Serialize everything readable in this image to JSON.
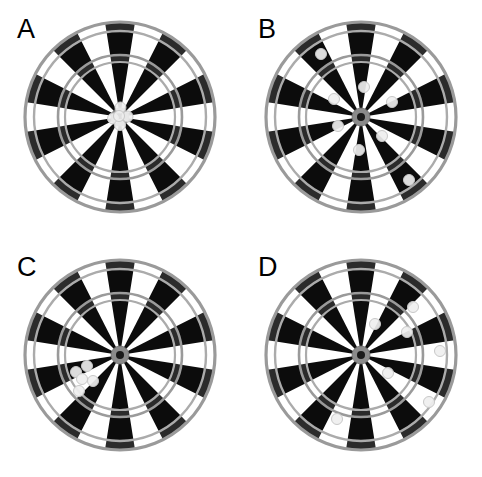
{
  "figure": {
    "width": 482,
    "height": 477,
    "background": "#ffffff"
  },
  "colors": {
    "black_segment": "#0c0c0c",
    "black_segment_ring": "#2b2b2b",
    "white_segment": "#ffffff",
    "ring_gray": "#9a9a9a",
    "ring_gray_light": "#ababab",
    "bull_outer": "#8a8a8a",
    "bull_inner": "#1a1a1a",
    "dart_fill": "#efefef",
    "dart_stroke": "#c8c8c8",
    "label_color": "#000000"
  },
  "board_geometry": {
    "segments": 20,
    "outer_radius": 95,
    "double_ring_outer": 95,
    "double_ring_inner": 86,
    "triple_ring_outer": 62,
    "triple_ring_inner": 55,
    "bull_outer_radius": 9,
    "bull_inner_radius": 4,
    "dart_radius": 5.5
  },
  "panels": [
    {
      "id": "A",
      "label": "A",
      "label_x": 17,
      "label_y": 16,
      "center_x": 120,
      "center_y": 117,
      "radius": 95,
      "pattern": "tight cluster at bullseye",
      "darts": [
        {
          "x": 0.5,
          "y": -9.5
        },
        {
          "x": -7.0,
          "y": 1.5
        },
        {
          "x": 7.5,
          "y": -0.5
        },
        {
          "x": 0.0,
          "y": 8.0
        },
        {
          "x": -1.0,
          "y": -1.0
        }
      ]
    },
    {
      "id": "B",
      "label": "B",
      "label_x": 258,
      "label_y": 16,
      "center_x": 361,
      "center_y": 117,
      "radius": 95,
      "pattern": "wide scatter around center",
      "darts": [
        {
          "x": -40.0,
          "y": -63.0
        },
        {
          "x": 3.0,
          "y": -30.0
        },
        {
          "x": -27.0,
          "y": -18.0
        },
        {
          "x": 31.0,
          "y": -15.0
        },
        {
          "x": -23.0,
          "y": 9.0
        },
        {
          "x": 21.0,
          "y": 19.0
        },
        {
          "x": -2.0,
          "y": 33.0
        },
        {
          "x": 48.0,
          "y": 63.0
        }
      ]
    },
    {
      "id": "C",
      "label": "C",
      "label_x": 17,
      "label_y": 254,
      "center_x": 120,
      "center_y": 355,
      "radius": 95,
      "pattern": "tight cluster offset lower-left",
      "darts": [
        {
          "x": -44.0,
          "y": 17.0
        },
        {
          "x": -33.0,
          "y": 11.0
        },
        {
          "x": -38.0,
          "y": 24.0
        },
        {
          "x": -27.0,
          "y": 26.0
        },
        {
          "x": -41.0,
          "y": 36.0
        }
      ]
    },
    {
      "id": "D",
      "label": "D",
      "label_x": 258,
      "label_y": 254,
      "center_x": 361,
      "center_y": 355,
      "radius": 95,
      "pattern": "wide scatter offset right",
      "darts": [
        {
          "x": 52.0,
          "y": -48.0
        },
        {
          "x": 14.0,
          "y": -31.0
        },
        {
          "x": 46.0,
          "y": -23.0
        },
        {
          "x": 79.0,
          "y": -4.0
        },
        {
          "x": 27.0,
          "y": 18.0
        },
        {
          "x": 68.0,
          "y": 47.0
        },
        {
          "x": -24.0,
          "y": 64.0
        }
      ]
    }
  ]
}
